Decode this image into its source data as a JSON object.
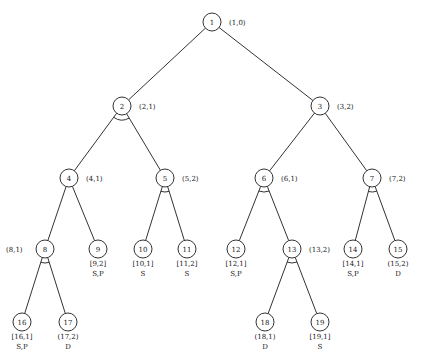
{
  "colors": {
    "stroke": "#333333",
    "text": "#222222",
    "background": "#ffffff"
  },
  "nodes": [
    {
      "id": "1",
      "x": 212,
      "y": 22,
      "label": "(1,0)",
      "label_pos": "right",
      "and_arc": false
    },
    {
      "id": "2",
      "x": 122,
      "y": 106,
      "label": "(2,1)",
      "label_pos": "right",
      "and_arc": true
    },
    {
      "id": "3",
      "x": 320,
      "y": 106,
      "label": "(3,2)",
      "label_pos": "right",
      "and_arc": false
    },
    {
      "id": "4",
      "x": 69,
      "y": 178,
      "label": "(4,1)",
      "label_pos": "right",
      "and_arc": false
    },
    {
      "id": "5",
      "x": 165,
      "y": 178,
      "label": "(5,2)",
      "label_pos": "right",
      "and_arc": true
    },
    {
      "id": "6",
      "x": 264,
      "y": 178,
      "label": "(6,1)",
      "label_pos": "right",
      "and_arc": true
    },
    {
      "id": "7",
      "x": 372,
      "y": 178,
      "label": "(7,2)",
      "label_pos": "right",
      "and_arc": true
    },
    {
      "id": "8",
      "x": 45,
      "y": 249,
      "label": "(8,1)",
      "label_pos": "left",
      "and_arc": true
    },
    {
      "id": "9",
      "x": 98,
      "y": 249,
      "label": "[9,2]",
      "label_pos": "below",
      "status": "S,P",
      "and_arc": false
    },
    {
      "id": "10",
      "x": 143,
      "y": 249,
      "label": "[10,1]",
      "label_pos": "below",
      "status": "S",
      "and_arc": false
    },
    {
      "id": "11",
      "x": 187,
      "y": 249,
      "label": "[11,2]",
      "label_pos": "below",
      "status": "S",
      "and_arc": false
    },
    {
      "id": "12",
      "x": 236,
      "y": 249,
      "label": "[12,1]",
      "label_pos": "below",
      "status": "S,P",
      "and_arc": false
    },
    {
      "id": "13",
      "x": 292,
      "y": 249,
      "label": "(13,2)",
      "label_pos": "right",
      "and_arc": true
    },
    {
      "id": "14",
      "x": 353,
      "y": 249,
      "label": "[14,1]",
      "label_pos": "below",
      "status": "S,P",
      "and_arc": false
    },
    {
      "id": "15",
      "x": 398,
      "y": 249,
      "label": "(15,2)",
      "label_pos": "below",
      "status": "D",
      "and_arc": false
    },
    {
      "id": "16",
      "x": 22,
      "y": 322,
      "label": "[16,1]",
      "label_pos": "below",
      "status": "S,P",
      "and_arc": false
    },
    {
      "id": "17",
      "x": 68,
      "y": 322,
      "label": "(17,2)",
      "label_pos": "below",
      "status": "D",
      "and_arc": false
    },
    {
      "id": "18",
      "x": 265,
      "y": 322,
      "label": "(18,1)",
      "label_pos": "below",
      "status": "D",
      "and_arc": false
    },
    {
      "id": "19",
      "x": 320,
      "y": 322,
      "label": "[19,1]",
      "label_pos": "below",
      "status": "S",
      "and_arc": false
    }
  ],
  "edges": [
    [
      "1",
      "2"
    ],
    [
      "1",
      "3"
    ],
    [
      "2",
      "4"
    ],
    [
      "2",
      "5"
    ],
    [
      "3",
      "6"
    ],
    [
      "3",
      "7"
    ],
    [
      "4",
      "8"
    ],
    [
      "4",
      "9"
    ],
    [
      "5",
      "10"
    ],
    [
      "5",
      "11"
    ],
    [
      "6",
      "12"
    ],
    [
      "6",
      "13"
    ],
    [
      "7",
      "14"
    ],
    [
      "7",
      "15"
    ],
    [
      "8",
      "16"
    ],
    [
      "8",
      "17"
    ],
    [
      "13",
      "18"
    ],
    [
      "13",
      "19"
    ]
  ]
}
